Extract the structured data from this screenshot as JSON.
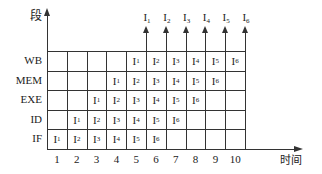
{
  "diagram": {
    "y_axis_label": "段",
    "x_axis_label": "时间",
    "stages": [
      "WB",
      "MEM",
      "EXE",
      "ID",
      "IF"
    ],
    "time_ticks": [
      "1",
      "2",
      "3",
      "4",
      "5",
      "6",
      "7",
      "8",
      "9",
      "10"
    ],
    "completed_instructions": [
      "I1",
      "I2",
      "I3",
      "I4",
      "I5",
      "I6"
    ],
    "grid": {
      "WB": [
        "",
        "",
        "",
        "",
        "I1",
        "I2",
        "I3",
        "I4",
        "I5",
        "I6"
      ],
      "MEM": [
        "",
        "",
        "",
        "I1",
        "I2",
        "I3",
        "I4",
        "I5",
        "I6",
        ""
      ],
      "EXE": [
        "",
        "",
        "I1",
        "I2",
        "I3",
        "I4",
        "I5",
        "I6",
        "",
        ""
      ],
      "ID": [
        "",
        "I1",
        "I2",
        "I3",
        "I4",
        "I5",
        "I6",
        "",
        "",
        ""
      ],
      "IF": [
        "I1",
        "I2",
        "I3",
        "I4",
        "I5",
        "I6",
        "",
        "",
        "",
        ""
      ]
    }
  }
}
